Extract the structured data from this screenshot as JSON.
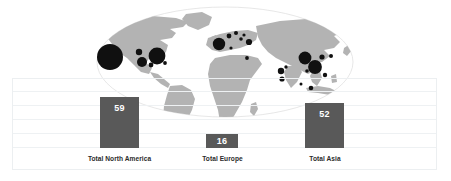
{
  "chart_data": {
    "type": "bar",
    "title": "",
    "subtitle": "",
    "xlabel": "",
    "ylabel": "",
    "categories": [
      "Total North America",
      "Total Europe",
      "Total Asia"
    ],
    "values": [
      59,
      16,
      52
    ],
    "value_labels": [
      "59",
      "16",
      "52"
    ],
    "ylim": [
      0,
      70
    ],
    "grid": true,
    "gridlines": [
      10,
      20,
      30,
      40,
      50,
      60
    ],
    "legend": "none",
    "legend_position": "none",
    "series": [
      {
        "name": "Regional totals",
        "values": [
          59,
          16,
          52
        ]
      }
    ],
    "bar_color": "#595959",
    "value_label_color": "#ffffff",
    "category_label_color": "#2b2b2b",
    "overlay": {
      "type": "proportional-symbol-map",
      "projection": "robinson",
      "land_color": "#b3b3b3",
      "ocean_color": "#ffffff",
      "outline_color": "#d9d9d9",
      "bubble_color": "#101010",
      "bubbles": [
        {
          "region": "North America",
          "cx": 110,
          "cy": 57,
          "r": 13.0
        },
        {
          "region": "North America",
          "cx": 139,
          "cy": 52,
          "r": 3.2
        },
        {
          "region": "North America",
          "cx": 142,
          "cy": 62,
          "r": 5.0
        },
        {
          "region": "North America",
          "cx": 157,
          "cy": 56,
          "r": 8.4
        },
        {
          "region": "North America",
          "cx": 151,
          "cy": 65,
          "r": 2.4
        },
        {
          "region": "North America",
          "cx": 165,
          "cy": 63,
          "r": 1.9
        },
        {
          "region": "Europe",
          "cx": 219,
          "cy": 44,
          "r": 6.2
        },
        {
          "region": "Europe",
          "cx": 229,
          "cy": 36,
          "r": 2.4
        },
        {
          "region": "Europe",
          "cx": 236,
          "cy": 33,
          "r": 2.0
        },
        {
          "region": "Europe",
          "cx": 241,
          "cy": 39,
          "r": 1.8
        },
        {
          "region": "Europe",
          "cx": 244,
          "cy": 35,
          "r": 1.6
        },
        {
          "region": "Europe",
          "cx": 249,
          "cy": 42,
          "r": 3.1
        },
        {
          "region": "Europe",
          "cx": 231,
          "cy": 48,
          "r": 1.6
        },
        {
          "region": "Europe",
          "cx": 247,
          "cy": 58,
          "r": 1.9
        },
        {
          "region": "Asia",
          "cx": 281,
          "cy": 71,
          "r": 3.2
        },
        {
          "region": "Asia",
          "cx": 282,
          "cy": 79,
          "r": 2.6
        },
        {
          "region": "Asia",
          "cx": 286,
          "cy": 67,
          "r": 1.7
        },
        {
          "region": "Asia",
          "cx": 305,
          "cy": 58,
          "r": 6.4
        },
        {
          "region": "Asia",
          "cx": 315,
          "cy": 67,
          "r": 6.9
        },
        {
          "region": "Asia",
          "cx": 307,
          "cy": 71,
          "r": 1.8
        },
        {
          "region": "Asia",
          "cx": 322,
          "cy": 57,
          "r": 2.6
        },
        {
          "region": "Asia",
          "cx": 331,
          "cy": 56,
          "r": 2.0
        },
        {
          "region": "Asia",
          "cx": 325,
          "cy": 75,
          "r": 2.2
        },
        {
          "region": "Asia",
          "cx": 311,
          "cy": 88,
          "r": 2.3
        },
        {
          "region": "Asia",
          "cx": 301,
          "cy": 84,
          "r": 1.5
        }
      ]
    }
  },
  "chart": {
    "plot": {
      "left": 12,
      "top": 78,
      "width": 425,
      "height": 92,
      "baseline_y": 148
    },
    "bars": [
      {
        "key": "north-america",
        "label": "Total North America",
        "value_label": "59",
        "x": 100,
        "width": 39,
        "top": 97,
        "height": 51,
        "label_x": 67,
        "label_width": 105,
        "label_y": 155
      },
      {
        "key": "europe",
        "label": "Total Europe",
        "value_label": "16",
        "x": 206,
        "width": 32,
        "top": 134,
        "height": 14,
        "label_x": 176,
        "label_width": 93,
        "label_y": 155
      },
      {
        "key": "asia",
        "label": "Total Asia",
        "value_label": "52",
        "x": 305,
        "width": 39,
        "top": 103,
        "height": 45,
        "label_x": 280,
        "label_width": 90,
        "label_y": 155
      }
    ],
    "gridline_y": [
      90,
      104,
      118,
      132,
      146
    ]
  }
}
